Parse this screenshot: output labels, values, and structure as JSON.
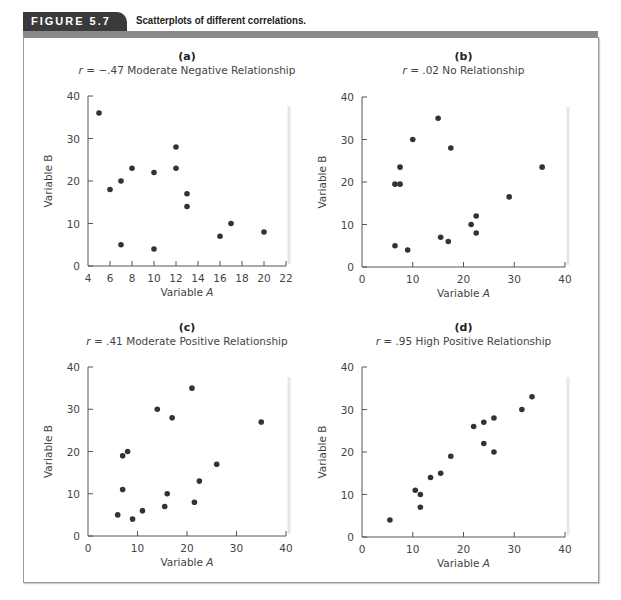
{
  "figure": {
    "label": "FIGURE 5.7",
    "caption": "Scatterplots of different correlations.",
    "colors": {
      "tab": "#3a3a3a",
      "bar": "#8a8a8a",
      "dot": "#333333",
      "axis": "#555555",
      "text": "#444444"
    }
  },
  "chart_data": [
    {
      "type": "scatter",
      "panel": "(a)",
      "title": "r = −.47 Moderate Negative Relationship",
      "r": "−.47",
      "description": "Moderate Negative Relationship",
      "xlabel": "Variable A",
      "ylabel": "Variable B",
      "xlim": [
        4,
        22
      ],
      "ylim": [
        0,
        40
      ],
      "xticks": [
        4,
        6,
        8,
        10,
        12,
        14,
        16,
        18,
        20,
        22
      ],
      "yticks": [
        0,
        10,
        20,
        30,
        40
      ],
      "points": [
        [
          5,
          36
        ],
        [
          6,
          18
        ],
        [
          7,
          20
        ],
        [
          7,
          5
        ],
        [
          8,
          23
        ],
        [
          10,
          22
        ],
        [
          10,
          4
        ],
        [
          12,
          28
        ],
        [
          12,
          23
        ],
        [
          13,
          17
        ],
        [
          13,
          14
        ],
        [
          16,
          7
        ],
        [
          17,
          10
        ],
        [
          20,
          8
        ]
      ]
    },
    {
      "type": "scatter",
      "panel": "(b)",
      "title": "r = .02 No Relationship",
      "r": ".02",
      "description": "No Relationship",
      "xlabel": "Variable A",
      "ylabel": "Variable B",
      "xlim": [
        0,
        40
      ],
      "ylim": [
        0,
        40
      ],
      "xticks": [
        0,
        10,
        20,
        30,
        40
      ],
      "yticks": [
        0,
        10,
        20,
        30,
        40
      ],
      "points": [
        [
          6.5,
          5
        ],
        [
          6.5,
          19.5
        ],
        [
          7.5,
          19.5
        ],
        [
          7.5,
          23.5
        ],
        [
          9,
          4
        ],
        [
          10,
          30
        ],
        [
          15,
          35
        ],
        [
          15.5,
          7
        ],
        [
          17,
          6
        ],
        [
          17.5,
          28
        ],
        [
          21.5,
          10
        ],
        [
          22.5,
          12
        ],
        [
          22.5,
          8
        ],
        [
          29,
          16.5
        ],
        [
          35.5,
          23.5
        ]
      ]
    },
    {
      "type": "scatter",
      "panel": "(c)",
      "title": "r = .41 Moderate Positive Relationship",
      "r": ".41",
      "description": "Moderate Positive Relationship",
      "xlabel": "Variable A",
      "ylabel": "Variable B",
      "xlim": [
        0,
        40
      ],
      "ylim": [
        0,
        40
      ],
      "xticks": [
        0,
        10,
        20,
        30,
        40
      ],
      "yticks": [
        0,
        10,
        20,
        30,
        40
      ],
      "points": [
        [
          6,
          5
        ],
        [
          7,
          19
        ],
        [
          7,
          11
        ],
        [
          8,
          20
        ],
        [
          9,
          4
        ],
        [
          11,
          6
        ],
        [
          14,
          30
        ],
        [
          15.5,
          7
        ],
        [
          16,
          10
        ],
        [
          17,
          28
        ],
        [
          21,
          35
        ],
        [
          21.5,
          8
        ],
        [
          22.5,
          13
        ],
        [
          26,
          17
        ],
        [
          35,
          27
        ]
      ]
    },
    {
      "type": "scatter",
      "panel": "(d)",
      "title": "r = .95 High Positive Relationship",
      "r": ".95",
      "description": "High Positive Relationship",
      "xlabel": "Variable A",
      "ylabel": "Variable B",
      "xlim": [
        0,
        40
      ],
      "ylim": [
        0,
        40
      ],
      "xticks": [
        0,
        10,
        20,
        30,
        40
      ],
      "yticks": [
        0,
        10,
        20,
        30,
        40
      ],
      "points": [
        [
          5.5,
          4
        ],
        [
          10.5,
          11
        ],
        [
          11.5,
          10
        ],
        [
          11.5,
          7
        ],
        [
          13.5,
          14
        ],
        [
          15.5,
          15
        ],
        [
          17.5,
          19
        ],
        [
          22,
          26
        ],
        [
          24,
          27
        ],
        [
          24,
          22
        ],
        [
          26,
          28
        ],
        [
          26,
          20
        ],
        [
          31.5,
          30
        ],
        [
          33.5,
          33
        ]
      ]
    }
  ]
}
